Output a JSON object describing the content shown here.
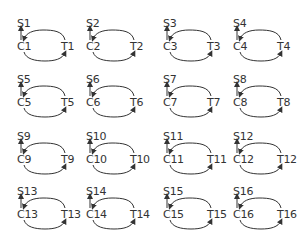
{
  "diagram": {
    "colors": {
      "stroke": "#333333",
      "background": "#ffffff"
    },
    "cells": [
      {
        "s": "S1",
        "c": "C1",
        "t": "T1",
        "x": 17,
        "y": 18
      },
      {
        "s": "S2",
        "c": "C2",
        "t": "T2",
        "x": 86,
        "y": 18
      },
      {
        "s": "S3",
        "c": "C3",
        "t": "T3",
        "x": 163,
        "y": 18
      },
      {
        "s": "S4",
        "c": "C4",
        "t": "T4",
        "x": 233,
        "y": 18
      },
      {
        "s": "S5",
        "c": "C5",
        "t": "T5",
        "x": 17,
        "y": 74
      },
      {
        "s": "S6",
        "c": "C6",
        "t": "T6",
        "x": 86,
        "y": 74
      },
      {
        "s": "S7",
        "c": "C7",
        "t": "T7",
        "x": 163,
        "y": 74
      },
      {
        "s": "S8",
        "c": "C8",
        "t": "T8",
        "x": 233,
        "y": 74
      },
      {
        "s": "S9",
        "c": "C9",
        "t": "T9",
        "x": 17,
        "y": 131
      },
      {
        "s": "S10",
        "c": "C10",
        "t": "T10",
        "x": 86,
        "y": 131
      },
      {
        "s": "S11",
        "c": "C11",
        "t": "T11",
        "x": 163,
        "y": 131
      },
      {
        "s": "S12",
        "c": "C12",
        "t": "T12",
        "x": 233,
        "y": 131
      },
      {
        "s": "S13",
        "c": "C13",
        "t": "T13",
        "x": 17,
        "y": 186
      },
      {
        "s": "S14",
        "c": "C14",
        "t": "T14",
        "x": 86,
        "y": 186
      },
      {
        "s": "S15",
        "c": "C15",
        "t": "T15",
        "x": 163,
        "y": 186
      },
      {
        "s": "S16",
        "c": "C16",
        "t": "T16",
        "x": 233,
        "y": 186
      }
    ]
  }
}
